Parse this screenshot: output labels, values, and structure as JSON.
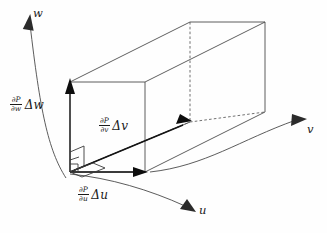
{
  "figure": {
    "background_color": "#fefefe",
    "line_color": "#4d4d4d",
    "vector_color": "#0d0d0d"
  },
  "axes": [
    {
      "id": "w",
      "label": "w",
      "direction": "up-left",
      "style": "curved-arrow"
    },
    {
      "id": "v",
      "label": "v",
      "direction": "right",
      "style": "curved-arrow"
    },
    {
      "id": "u",
      "label": "u",
      "direction": "down-right",
      "style": "curved-arrow"
    }
  ],
  "vectors": [
    {
      "id": "dw",
      "partial_numerator": "∂P",
      "partial_denominator": "∂w",
      "increment": "Δw",
      "direction": "up",
      "description": "partial derivative of P with respect to w times delta w"
    },
    {
      "id": "dv",
      "partial_numerator": "∂P",
      "partial_denominator": "∂v",
      "increment": "Δv",
      "direction": "up-right diagonal",
      "description": "partial derivative of P with respect to v times delta v"
    },
    {
      "id": "du",
      "partial_numerator": "∂P",
      "partial_denominator": "∂u",
      "increment": "Δu",
      "direction": "right",
      "description": "partial derivative of P with respect to u times delta u"
    }
  ],
  "annotations": {
    "right_angle_markers": 2,
    "box_hidden_edges": "dashed"
  }
}
